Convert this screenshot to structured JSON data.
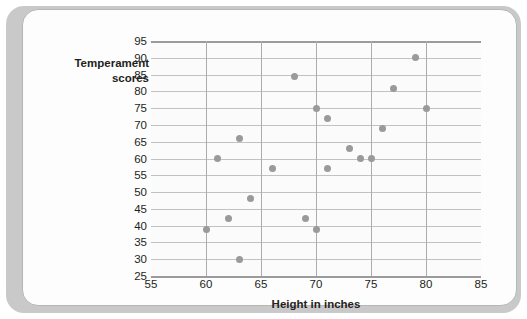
{
  "chart_data": {
    "type": "scatter",
    "title": "",
    "xlabel": "Height in inches",
    "ylabel": "Temperament scores",
    "ylabel_line1": "Temperament",
    "ylabel_line2": "scores",
    "xlim": [
      55,
      85
    ],
    "ylim": [
      25,
      95
    ],
    "xticks": [
      55,
      60,
      65,
      70,
      75,
      80,
      85
    ],
    "yticks": [
      25,
      30,
      35,
      40,
      45,
      50,
      55,
      60,
      65,
      70,
      75,
      80,
      85,
      90,
      95
    ],
    "grid": "both",
    "legend": "none",
    "marker_color": "#9a9a9a",
    "points": [
      {
        "x": 60,
        "y": 39
      },
      {
        "x": 61,
        "y": 60
      },
      {
        "x": 62,
        "y": 42
      },
      {
        "x": 63,
        "y": 66
      },
      {
        "x": 63,
        "y": 30
      },
      {
        "x": 64,
        "y": 48
      },
      {
        "x": 66,
        "y": 57
      },
      {
        "x": 68,
        "y": 84.5
      },
      {
        "x": 69,
        "y": 42
      },
      {
        "x": 70,
        "y": 75
      },
      {
        "x": 70,
        "y": 39
      },
      {
        "x": 71,
        "y": 72
      },
      {
        "x": 71,
        "y": 57
      },
      {
        "x": 73,
        "y": 63
      },
      {
        "x": 74,
        "y": 60
      },
      {
        "x": 75,
        "y": 60
      },
      {
        "x": 76,
        "y": 69
      },
      {
        "x": 77,
        "y": 81
      },
      {
        "x": 79,
        "y": 90
      },
      {
        "x": 80,
        "y": 75
      }
    ]
  }
}
